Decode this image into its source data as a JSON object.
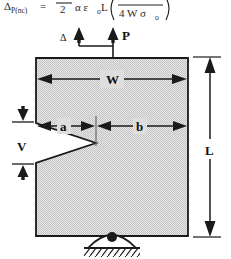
{
  "figure": {
    "equation": {
      "lhs": "Δ",
      "lhs_sub": "P(nc)",
      "equals": "=",
      "fraction_denominator": "2",
      "factors": "α ε",
      "factors_sub": "o",
      "factors_tail": "L",
      "bracket_open": "(",
      "inner_denominator": "4 W σ",
      "inner_denominator_sub": "o",
      "bracket_close": ")"
    },
    "labels": {
      "load": "P",
      "displacement": "Δ",
      "width": "W",
      "length": "L",
      "crack_length": "a",
      "ligament": "b",
      "notch_height": "V"
    },
    "icons": {
      "load_arrow": "up-arrow-icon",
      "displacement_arrow": "up-arrow-icon",
      "width_dimension": "double-headed-arrow-icon",
      "length_dimension": "double-headed-arrow-icon",
      "pin_support": "pin-support-icon",
      "hatching": "ground-hatching-icon"
    },
    "colors": {
      "specimen_fill": "#d6d6d6",
      "outline": "#1a1a1a",
      "notch_fill": "#ffffff",
      "text": "#111111"
    }
  }
}
